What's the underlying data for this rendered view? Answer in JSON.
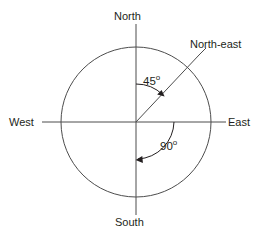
{
  "diagram": {
    "type": "compass-rose",
    "stroke_color": "#4d4d4d",
    "text_color": "#231f20",
    "background_color": "#ffffff",
    "center": {
      "x": 136,
      "y": 122
    },
    "radius": 75,
    "direction_labels": [
      {
        "id": "north",
        "text": "North",
        "bearing_deg": 0
      },
      {
        "id": "east",
        "text": "East",
        "bearing_deg": 90
      },
      {
        "id": "south",
        "text": "South",
        "bearing_deg": 180
      },
      {
        "id": "west",
        "text": "West",
        "bearing_deg": 270
      },
      {
        "id": "north-east",
        "text": "North-east",
        "bearing_deg": 45
      }
    ],
    "angle_annotations": [
      {
        "id": "angle-45",
        "value": "45",
        "degree_symbol": "o",
        "text": "45o",
        "from": "North",
        "to": "North-east",
        "sweep_deg": 45,
        "direction": "clockwise"
      },
      {
        "id": "angle-90",
        "value": "90",
        "degree_symbol": "o",
        "text": "90o",
        "from": "East",
        "to": "South",
        "sweep_deg": 90,
        "direction": "clockwise"
      }
    ],
    "axes": [
      {
        "id": "vertical-axis",
        "orientation": "vertical",
        "from": "North",
        "to": "South"
      },
      {
        "id": "horizontal-axis",
        "orientation": "horizontal",
        "from": "West",
        "to": "East"
      }
    ],
    "rays": [
      {
        "id": "northeast-ray",
        "bearing_deg": 45,
        "label": "North-east"
      }
    ]
  }
}
